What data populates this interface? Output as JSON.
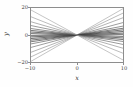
{
  "figure": {
    "background": "#fefefe",
    "frame_color": "#8d8d8d"
  },
  "chart_data": {
    "type": "line",
    "title": "",
    "subtitle": "",
    "xlabel": "x",
    "ylabel": "y",
    "xlim": [
      -10,
      10
    ],
    "ylim": [
      -20,
      20
    ],
    "xticks": [
      -10,
      0,
      10
    ],
    "yticks": [
      -20,
      0,
      20
    ],
    "xticklabels": [
      "−10",
      "0",
      "10"
    ],
    "yticklabels": [
      "−20",
      "0",
      "20"
    ],
    "grid": false,
    "legend": null,
    "annotations": [],
    "x": [
      -10,
      10
    ],
    "series": [
      {
        "name": "line-1",
        "slope": 1.95,
        "intercept": 0,
        "values": [
          -19.5,
          19.5
        ],
        "color": "#9a9a9a",
        "width": 0.6
      },
      {
        "name": "line-2",
        "slope": 1.62,
        "intercept": 0,
        "values": [
          -16.2,
          16.2
        ],
        "color": "#8a8a8a",
        "width": 0.6
      },
      {
        "name": "line-3",
        "slope": 1.28,
        "intercept": 0,
        "values": [
          -12.8,
          12.8
        ],
        "color": "#7d7d7d",
        "width": 0.6
      },
      {
        "name": "line-4",
        "slope": 0.92,
        "intercept": 0,
        "values": [
          -9.2,
          9.2
        ],
        "color": "#6f6f6f",
        "width": 0.7
      },
      {
        "name": "line-5",
        "slope": 0.66,
        "intercept": 0,
        "values": [
          -6.6,
          6.6
        ],
        "color": "#5f5f5f",
        "width": 0.7
      },
      {
        "name": "line-6",
        "slope": 0.5,
        "intercept": 0,
        "values": [
          -5.0,
          5.0
        ],
        "color": "#555555",
        "width": 0.8
      },
      {
        "name": "line-7",
        "slope": 0.38,
        "intercept": 0,
        "values": [
          -3.8,
          3.8
        ],
        "color": "#4a4a4a",
        "width": 0.8
      },
      {
        "name": "line-8",
        "slope": 0.26,
        "intercept": 0,
        "values": [
          -2.6,
          2.6
        ],
        "color": "#424242",
        "width": 0.8
      },
      {
        "name": "line-9",
        "slope": 0.14,
        "intercept": 0,
        "values": [
          -1.4,
          1.4
        ],
        "color": "#3d3d3d",
        "width": 0.8
      },
      {
        "name": "line-10",
        "slope": 0.04,
        "intercept": 0,
        "values": [
          -0.4,
          0.4
        ],
        "color": "#4a4a4a",
        "width": 0.7
      },
      {
        "name": "line-11",
        "slope": -0.1,
        "intercept": 0,
        "values": [
          1.0,
          -1.0
        ],
        "color": "#3f3f3f",
        "width": 0.8
      },
      {
        "name": "line-12",
        "slope": -0.22,
        "intercept": 0,
        "values": [
          2.2,
          -2.2
        ],
        "color": "#474747",
        "width": 0.8
      },
      {
        "name": "line-13",
        "slope": -0.34,
        "intercept": 0,
        "values": [
          3.4,
          -3.4
        ],
        "color": "#505050",
        "width": 0.8
      },
      {
        "name": "line-14",
        "slope": -0.48,
        "intercept": 0,
        "values": [
          4.8,
          -4.8
        ],
        "color": "#5b5b5b",
        "width": 0.7
      },
      {
        "name": "line-15",
        "slope": -0.7,
        "intercept": 0,
        "values": [
          7.0,
          -7.0
        ],
        "color": "#6b6b6b",
        "width": 0.7
      },
      {
        "name": "line-16",
        "slope": -0.98,
        "intercept": 0,
        "values": [
          9.8,
          -9.8
        ],
        "color": "#7a7a7a",
        "width": 0.6
      },
      {
        "name": "line-17",
        "slope": -1.35,
        "intercept": 0,
        "values": [
          13.5,
          -13.5
        ],
        "color": "#8b8b8b",
        "width": 0.6
      },
      {
        "name": "line-18",
        "slope": -1.85,
        "intercept": 0,
        "values": [
          18.5,
          -18.5
        ],
        "color": "#9c9c9c",
        "width": 0.6
      }
    ]
  }
}
